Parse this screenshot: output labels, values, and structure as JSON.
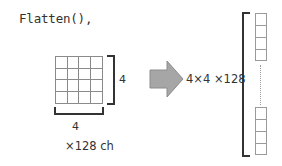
{
  "code_label": "Flatten(),",
  "input_tensor": {
    "rows": 4,
    "cols": 4,
    "height_label": "4",
    "width_label": "4",
    "channels_label": "×128 ch"
  },
  "arrow": {
    "color": "#a6a6a6",
    "direction": "right"
  },
  "output_label": "4×4 ×128",
  "output_vector": {
    "top_cells": 4,
    "bottom_cells": 4,
    "ellipsis": "⋮"
  }
}
